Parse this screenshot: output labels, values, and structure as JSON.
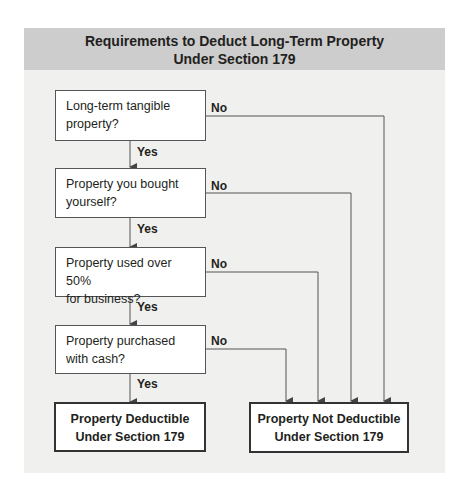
{
  "title": {
    "line1": "Requirements to Deduct Long-Term Property",
    "line2": "Under Section 179"
  },
  "questions": [
    {
      "line1": "Long-term tangible",
      "line2": "property?",
      "yes": "Yes",
      "no": "No"
    },
    {
      "line1": "Property you bought",
      "line2": "yourself?",
      "yes": "Yes",
      "no": "No"
    },
    {
      "line1": "Property used over 50%",
      "line2": "for business?",
      "yes": "Yes",
      "no": "No"
    },
    {
      "line1": "Property purchased",
      "line2": "with cash?",
      "yes": "Yes",
      "no": "No"
    }
  ],
  "outcomes": {
    "deductible": {
      "line1": "Property Deductible",
      "line2": "Under Section 179"
    },
    "not_deductible": {
      "line1": "Property Not Deductible",
      "line2": "Under Section 179"
    }
  },
  "colors": {
    "header_bg": "#cdcdcd",
    "panel_bg": "#f0f0ee",
    "line": "#555555"
  }
}
